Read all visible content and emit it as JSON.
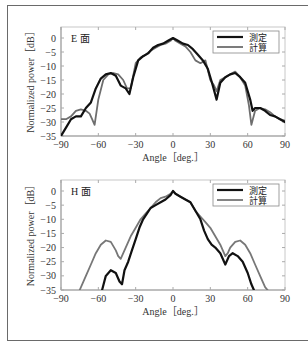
{
  "chart_data": [
    {
      "type": "line",
      "panel_label": "E 面",
      "xlabel": "Angle［deg.］",
      "ylabel": "Normalized power［dB］",
      "xlim": [
        -90,
        90
      ],
      "ylim": [
        -35,
        0
      ],
      "xticks": [
        -90,
        -60,
        -30,
        0,
        30,
        60,
        90
      ],
      "yticks": [
        0,
        -5,
        -10,
        -15,
        -20,
        -25,
        -30,
        -35
      ],
      "grid": false,
      "legend": {
        "position": "upper right",
        "entries": [
          "測定",
          "計算"
        ]
      },
      "series": [
        {
          "name": "測定",
          "color": "#111111",
          "width": 2.2,
          "x": [
            -90,
            -86,
            -82,
            -78,
            -74,
            -70,
            -66,
            -62,
            -58,
            -54,
            -50,
            -46,
            -42,
            -38,
            -35,
            -32,
            -28,
            -24,
            -20,
            -16,
            -12,
            -8,
            -4,
            0,
            4,
            8,
            12,
            16,
            20,
            24,
            28,
            32,
            35,
            38,
            42,
            46,
            50,
            54,
            58,
            62,
            64,
            66,
            70,
            74,
            78,
            82,
            86,
            90
          ],
          "y": [
            -35,
            -32,
            -29,
            -28,
            -28,
            -25,
            -23,
            -18,
            -14.5,
            -13,
            -12.5,
            -13.5,
            -17,
            -18,
            -20,
            -14,
            -8,
            -6.5,
            -5.5,
            -3.5,
            -2.5,
            -2,
            -1,
            0,
            -1,
            -2,
            -2.5,
            -4,
            -6,
            -8,
            -11,
            -17,
            -22,
            -16,
            -14,
            -13,
            -12.5,
            -14,
            -16,
            -22,
            -26,
            -25,
            -25,
            -26,
            -27.5,
            -28,
            -29,
            -30
          ]
        },
        {
          "name": "計算",
          "color": "#6e6e6e",
          "width": 1.8,
          "x": [
            -90,
            -86,
            -82,
            -78,
            -74,
            -70,
            -67,
            -65,
            -63,
            -60,
            -56,
            -52,
            -48,
            -44,
            -40,
            -37,
            -34,
            -30,
            -26,
            -22,
            -18,
            -14,
            -10,
            -6,
            -2,
            0,
            2,
            6,
            10,
            14,
            18,
            22,
            26,
            30,
            33,
            35,
            38,
            42,
            46,
            50,
            54,
            58,
            61,
            63,
            66,
            70,
            74,
            78,
            82,
            86,
            90
          ],
          "y": [
            -29,
            -29,
            -28,
            -26,
            -25.5,
            -26,
            -27,
            -29,
            -31,
            -22,
            -15,
            -13,
            -12.5,
            -13,
            -15,
            -18,
            -18,
            -9,
            -7,
            -6,
            -4.5,
            -3.5,
            -2.5,
            -2,
            -1,
            0,
            -1,
            -2,
            -3,
            -5,
            -8,
            -9,
            -8,
            -15,
            -17,
            -19,
            -15,
            -14,
            -13,
            -12,
            -14,
            -17,
            -24,
            -31,
            -26,
            -25,
            -25.5,
            -26.5,
            -28,
            -29,
            -29.5
          ]
        }
      ]
    },
    {
      "type": "line",
      "panel_label": "H 面",
      "xlabel": "Angle［deg.］",
      "ylabel": "Normalized power［dB］",
      "xlim": [
        -90,
        90
      ],
      "ylim": [
        -35,
        0
      ],
      "xticks": [
        -90,
        -60,
        -30,
        0,
        30,
        60,
        90
      ],
      "yticks": [
        0,
        -5,
        -10,
        -15,
        -20,
        -25,
        -30,
        -35
      ],
      "grid": false,
      "legend": {
        "position": "upper right",
        "entries": [
          "測定",
          "計算"
        ]
      },
      "series": [
        {
          "name": "測定",
          "color": "#111111",
          "width": 2.2,
          "x": [
            -57,
            -54,
            -50,
            -46,
            -43,
            -41,
            -39,
            -36,
            -33,
            -30,
            -27,
            -24,
            -21,
            -18,
            -14,
            -10,
            -6,
            -2,
            0,
            2,
            6,
            10,
            14,
            18,
            22,
            25,
            28,
            31,
            34,
            38,
            42,
            45,
            48,
            52,
            56,
            60,
            63,
            65
          ],
          "y": [
            -35,
            -30,
            -28,
            -29,
            -32,
            -33,
            -28,
            -25,
            -21,
            -17,
            -13,
            -10,
            -8,
            -6,
            -5,
            -4,
            -3,
            -1.5,
            0,
            -1,
            -2,
            -3,
            -4,
            -7,
            -10,
            -14,
            -17,
            -19,
            -20,
            -22,
            -26,
            -23,
            -22,
            -23,
            -25,
            -29,
            -33,
            -35
          ],
          "x_clip_note": "curve exits below -35 dB at both ends"
        },
        {
          "name": "計算",
          "color": "#777777",
          "width": 1.8,
          "x": [
            -75,
            -70,
            -66,
            -62,
            -58,
            -54,
            -50,
            -46,
            -44,
            -42,
            -38,
            -34,
            -30,
            -26,
            -22,
            -18,
            -14,
            -10,
            -6,
            -2,
            0,
            2,
            6,
            10,
            14,
            18,
            22,
            26,
            30,
            34,
            38,
            42,
            44,
            46,
            50,
            54,
            58,
            62,
            66,
            70,
            74,
            76
          ],
          "y": [
            -35,
            -30,
            -26,
            -22,
            -19,
            -17.5,
            -18,
            -21,
            -23,
            -24,
            -20,
            -16,
            -13,
            -10,
            -8,
            -6,
            -4,
            -2.5,
            -2,
            -1,
            0,
            -1,
            -2,
            -3,
            -4,
            -7,
            -9,
            -11,
            -13,
            -16,
            -19,
            -23,
            -22,
            -20,
            -18,
            -17.5,
            -19,
            -22,
            -26,
            -30,
            -34,
            -35
          ]
        }
      ]
    }
  ]
}
